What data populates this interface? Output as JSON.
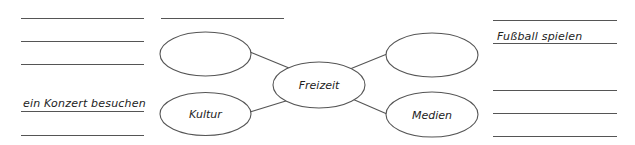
{
  "mindmap": {
    "center": {
      "label": "Freizeit"
    },
    "nodes": [
      {
        "position": "top-left",
        "label": ""
      },
      {
        "position": "bottom-left",
        "label": "Kultur"
      },
      {
        "position": "top-right",
        "label": ""
      },
      {
        "position": "bottom-right",
        "label": "Medien"
      }
    ]
  },
  "left_lines": [
    {
      "text": ""
    },
    {
      "text": ""
    },
    {
      "text": ""
    },
    {
      "text": "ein Konzert besuchen"
    },
    {
      "text": ""
    }
  ],
  "top_middle_line": {
    "text": ""
  },
  "right_lines": [
    {
      "text": ""
    },
    {
      "text": "Fußball spielen"
    },
    {
      "text": ""
    },
    {
      "text": ""
    },
    {
      "text": ""
    }
  ],
  "colors": {
    "stroke": "#555555",
    "text": "#222222",
    "background": "#ffffff"
  }
}
